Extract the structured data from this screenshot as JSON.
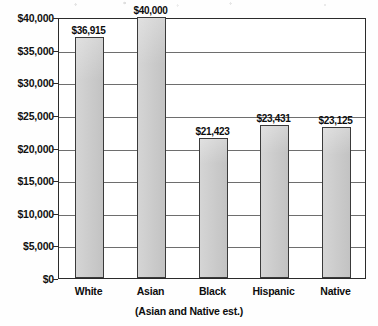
{
  "chart_data": {
    "type": "bar",
    "title": "",
    "subtitle": "",
    "caption": "(Asian and Native est.)",
    "xlabel": "",
    "ylabel": "",
    "categories": [
      "White",
      "Asian",
      "Black",
      "Hispanic",
      "Native"
    ],
    "values": [
      36915,
      40000,
      21423,
      23431,
      23125
    ],
    "value_labels": [
      "$36,915",
      "$40,000",
      "$21,423",
      "$23,431",
      "$23,125"
    ],
    "ylim": [
      0,
      40000
    ],
    "ytick_step": 5000,
    "ytick_labels": [
      "$40,000",
      "$35,000",
      "$30,000",
      "$25,000",
      "$20,000",
      "$15,000",
      "$10,000",
      "$5,000",
      "$0"
    ],
    "ytick_values": [
      40000,
      35000,
      30000,
      25000,
      20000,
      15000,
      10000,
      5000,
      0
    ],
    "grid": true,
    "grid_axis": "y",
    "legend": false,
    "legend_position": "none",
    "bar_fill_color": "#c9c9c9",
    "bar_border_color": "#3a3a3a",
    "axis_color": "#2b2b2b",
    "grid_color": "#555555",
    "background_color": "#ffffff",
    "text_color": "#0d0d0d"
  }
}
